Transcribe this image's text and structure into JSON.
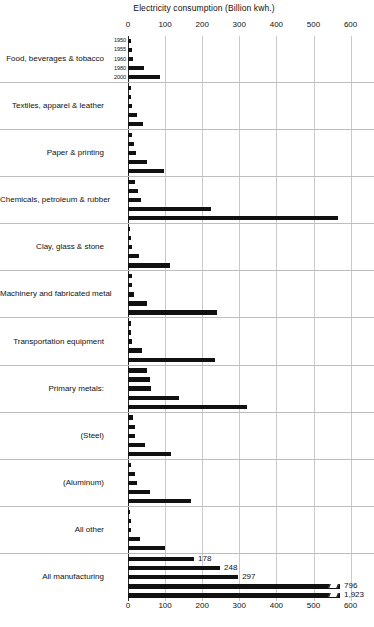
{
  "chart_data": {
    "type": "bar",
    "orientation": "horizontal",
    "title": "Electricity consumption (Billion kwh.)",
    "xlabel": "",
    "ylabel": "",
    "xlim": [
      0,
      600
    ],
    "xticks": [
      0,
      100,
      200,
      300,
      400,
      500,
      600
    ],
    "grid": true,
    "legend": "none",
    "series_labels": [
      "1950",
      "1955",
      "1960",
      "1980",
      "2000"
    ],
    "axis_note": "Last two bars of All manufacturing are axis-broken",
    "categories": [
      "Food, beverages & tobacco",
      "Textiles, apparel & leather",
      "Paper & printing",
      "Chemicals, petroleum & rubber",
      "Clay, glass & stone",
      "Machinery and fabricated metal",
      "Transportation equipment",
      "Primary metals:",
      "(Steel)",
      "(Aluminum)",
      "All other",
      "All manufacturing"
    ],
    "groups": [
      {
        "category": "Food, beverages & tobacco",
        "bars": [
          {
            "year": "1950",
            "value": 8,
            "label": ""
          },
          {
            "year": "1955",
            "value": 10,
            "label": ""
          },
          {
            "year": "1960",
            "value": 13,
            "label": ""
          },
          {
            "year": "1980",
            "value": 42,
            "label": ""
          },
          {
            "year": "2000",
            "value": 85,
            "label": ""
          }
        ]
      },
      {
        "category": "Textiles, apparel & leather",
        "bars": [
          {
            "year": "1950",
            "value": 7,
            "label": ""
          },
          {
            "year": "1955",
            "value": 9,
            "label": ""
          },
          {
            "year": "1960",
            "value": 11,
            "label": ""
          },
          {
            "year": "1980",
            "value": 24,
            "label": ""
          },
          {
            "year": "2000",
            "value": 40,
            "label": ""
          }
        ]
      },
      {
        "category": "Paper & printing",
        "bars": [
          {
            "year": "1950",
            "value": 12,
            "label": ""
          },
          {
            "year": "1955",
            "value": 17,
            "label": ""
          },
          {
            "year": "1960",
            "value": 22,
            "label": ""
          },
          {
            "year": "1980",
            "value": 52,
            "label": ""
          },
          {
            "year": "2000",
            "value": 97,
            "label": ""
          }
        ]
      },
      {
        "category": "Chemicals, petroleum & rubber",
        "bars": [
          {
            "year": "1950",
            "value": 20,
            "label": ""
          },
          {
            "year": "1955",
            "value": 27,
            "label": ""
          },
          {
            "year": "1960",
            "value": 34,
            "label": ""
          },
          {
            "year": "1980",
            "value": 225,
            "label": ""
          },
          {
            "year": "2000",
            "value": 565,
            "label": ""
          }
        ]
      },
      {
        "category": "Clay, glass & stone",
        "bars": [
          {
            "year": "1950",
            "value": 6,
            "label": ""
          },
          {
            "year": "1955",
            "value": 8,
            "label": ""
          },
          {
            "year": "1960",
            "value": 10,
            "label": ""
          },
          {
            "year": "1980",
            "value": 30,
            "label": ""
          },
          {
            "year": "2000",
            "value": 113,
            "label": ""
          }
        ]
      },
      {
        "category": "Machinery and fabricated metal",
        "bars": [
          {
            "year": "1950",
            "value": 10,
            "label": ""
          },
          {
            "year": "1955",
            "value": 12,
            "label": ""
          },
          {
            "year": "1960",
            "value": 16,
            "label": ""
          },
          {
            "year": "1980",
            "value": 52,
            "label": ""
          },
          {
            "year": "2000",
            "value": 240,
            "label": ""
          }
        ]
      },
      {
        "category": "Transportation equipment",
        "bars": [
          {
            "year": "1950",
            "value": 8,
            "label": ""
          },
          {
            "year": "1955",
            "value": 9,
            "label": ""
          },
          {
            "year": "1960",
            "value": 11,
            "label": ""
          },
          {
            "year": "1980",
            "value": 38,
            "label": ""
          },
          {
            "year": "2000",
            "value": 235,
            "label": ""
          }
        ]
      },
      {
        "category": "Primary metals:",
        "bars": [
          {
            "year": "1950",
            "value": 50,
            "label": ""
          },
          {
            "year": "1955",
            "value": 60,
            "label": ""
          },
          {
            "year": "1960",
            "value": 62,
            "label": ""
          },
          {
            "year": "1980",
            "value": 137,
            "label": ""
          },
          {
            "year": "2000",
            "value": 320,
            "label": ""
          }
        ]
      },
      {
        "category": "(Steel)",
        "bars": [
          {
            "year": "1950",
            "value": 14,
            "label": ""
          },
          {
            "year": "1955",
            "value": 18,
            "label": ""
          },
          {
            "year": "1960",
            "value": 20,
            "label": ""
          },
          {
            "year": "1980",
            "value": 45,
            "label": ""
          },
          {
            "year": "2000",
            "value": 115,
            "label": ""
          }
        ]
      },
      {
        "category": "(Aluminum)",
        "bars": [
          {
            "year": "1950",
            "value": 7,
            "label": ""
          },
          {
            "year": "1955",
            "value": 20,
            "label": ""
          },
          {
            "year": "1960",
            "value": 25,
            "label": ""
          },
          {
            "year": "1980",
            "value": 58,
            "label": ""
          },
          {
            "year": "2000",
            "value": 170,
            "label": ""
          }
        ]
      },
      {
        "category": "All other",
        "bars": [
          {
            "year": "1950",
            "value": 4,
            "label": ""
          },
          {
            "year": "1955",
            "value": 7,
            "label": ""
          },
          {
            "year": "1960",
            "value": 9,
            "label": ""
          },
          {
            "year": "1980",
            "value": 32,
            "label": ""
          },
          {
            "year": "2000",
            "value": 100,
            "label": ""
          }
        ]
      },
      {
        "category": "All manufacturing",
        "bars": [
          {
            "year": "1950",
            "value": 178,
            "label": "178",
            "broken": false
          },
          {
            "year": "1955",
            "value": 248,
            "label": "248",
            "broken": false
          },
          {
            "year": "1960",
            "value": 297,
            "label": "297",
            "broken": false
          },
          {
            "year": "1980",
            "value": 796,
            "label": "796",
            "broken": true
          },
          {
            "year": "2000",
            "value": 1923,
            "label": "1,923",
            "broken": true
          }
        ]
      }
    ]
  },
  "colors": {
    "bar": "#111111",
    "gridline": "#c9c9c9",
    "separator": "#bdbdbd",
    "axis": "#2a2a2a",
    "text": "#111111",
    "background": "#ffffff"
  }
}
